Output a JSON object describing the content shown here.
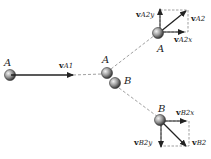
{
  "diagram": {
    "type": "collision-diagram",
    "colors": {
      "line": "#222222",
      "dashed": "#888888",
      "ball_dark": "#333333",
      "ball_light": "#d8d8d8"
    },
    "labels": {
      "ball_a_initial": "A",
      "ball_a_collision": "A",
      "ball_b_collision": "B",
      "ball_a_final": "A",
      "ball_b_final": "B"
    },
    "vectors": {
      "vA1": {
        "bold": "v",
        "sub": "A1"
      },
      "vA2": {
        "bold": "v",
        "sub": "A2"
      },
      "vA2x": {
        "bold": "v",
        "sub": "A2x"
      },
      "vA2y": {
        "bold": "v",
        "sub": "A2y"
      },
      "vB2": {
        "bold": "v",
        "sub": "B2"
      },
      "vB2x": {
        "bold": "v",
        "sub": "B2x"
      },
      "vB2y": {
        "bold": "v",
        "sub": "B2y"
      }
    }
  }
}
